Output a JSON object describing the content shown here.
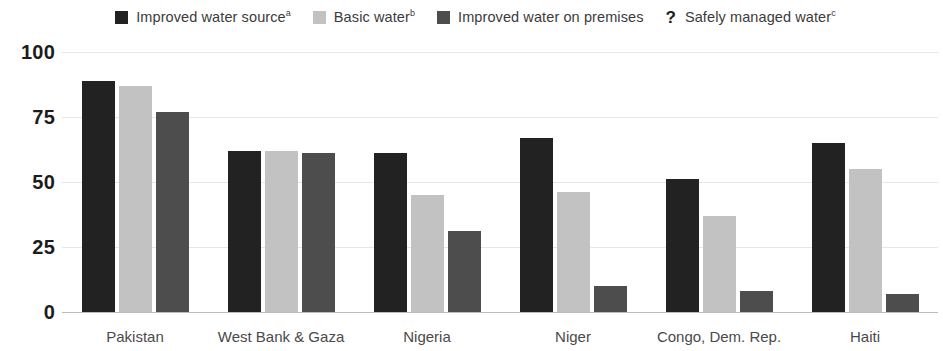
{
  "legend": {
    "items": [
      {
        "label": "Improved water source",
        "sup": "a",
        "marker": "square",
        "color": "#222222",
        "name": "legend-improved-water-source"
      },
      {
        "label": "Basic water",
        "sup": "b",
        "marker": "square",
        "color": "#c2c2c2",
        "name": "legend-basic-water"
      },
      {
        "label": "Improved water on premises",
        "sup": "",
        "marker": "square",
        "color": "#4d4d4d",
        "name": "legend-improved-water-on-premises"
      },
      {
        "label": "Safely managed water",
        "sup": "c",
        "marker": "question",
        "color": "#1a1a1a",
        "name": "legend-safely-managed-water"
      }
    ]
  },
  "chart_data": {
    "type": "bar",
    "title": "",
    "xlabel": "",
    "ylabel": "",
    "ylim": [
      0,
      100
    ],
    "yticks": [
      0,
      25,
      50,
      75,
      100
    ],
    "grid": true,
    "legend_position": "top",
    "categories": [
      "Pakistan",
      "West Bank & Gaza",
      "Nigeria",
      "Niger",
      "Congo, Dem. Rep.",
      "Haiti"
    ],
    "series": [
      {
        "name": "Improved water source",
        "color": "#222222",
        "values": [
          89,
          62,
          61,
          67,
          51,
          65
        ]
      },
      {
        "name": "Basic water",
        "color": "#c2c2c2",
        "values": [
          87,
          62,
          45,
          46,
          37,
          55
        ]
      },
      {
        "name": "Improved water on premises",
        "color": "#4d4d4d",
        "values": [
          77,
          61,
          31,
          10,
          8,
          7
        ]
      },
      {
        "name": "Safely managed water",
        "color": "#1a1a1a",
        "values": [
          null,
          null,
          null,
          null,
          null,
          null
        ]
      }
    ]
  }
}
